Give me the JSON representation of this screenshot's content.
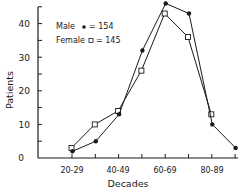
{
  "chart_data": {
    "type": "line",
    "title": "",
    "xlabel": "Decades",
    "ylabel": "Patients",
    "ylim": [
      0,
      45
    ],
    "yticks": [
      0,
      10,
      20,
      30,
      40
    ],
    "categories": [
      "20-29",
      "30-39",
      "40-49",
      "50-59",
      "60-69",
      "70-79",
      "80-89",
      "90-99"
    ],
    "xtick_labels_shown": [
      "20-29",
      "40-49",
      "60-69",
      "80-89"
    ],
    "grid": false,
    "legend_position": "upper-left",
    "series": [
      {
        "name": "Male",
        "marker": "filled-circle",
        "n": 154,
        "values": [
          2,
          5,
          13,
          32,
          46,
          43,
          10,
          3
        ]
      },
      {
        "name": "Female",
        "marker": "open-square",
        "n": 145,
        "values": [
          3,
          10,
          14,
          26,
          43,
          36,
          13,
          null
        ]
      }
    ]
  },
  "legend": {
    "male": "Male",
    "male_count": "= 154",
    "female": "Female",
    "female_count": "= 145"
  },
  "axes": {
    "y_label": "Patients",
    "x_label": "Decades",
    "y_ticks": [
      "0",
      "10",
      "20",
      "30",
      "40"
    ],
    "x_ticks": [
      "20-29",
      "40-49",
      "60-69",
      "80-89"
    ]
  },
  "colors": {
    "ink": "#1a1a1a",
    "background": "#ffffff"
  }
}
